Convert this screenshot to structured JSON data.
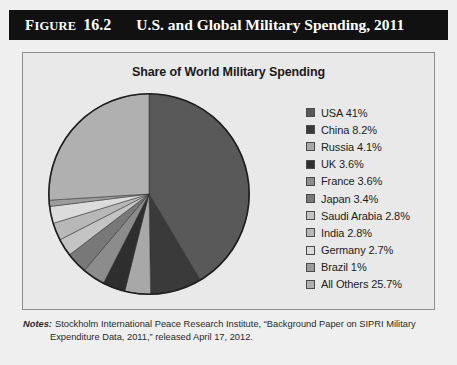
{
  "figure": {
    "label_first": "F",
    "label_rest": "IGURE",
    "number": "16.2",
    "title": "U.S. and Global Military Spending, 2011"
  },
  "chart_data": {
    "type": "pie",
    "title": "Share of World Military Spending",
    "xlabel": "",
    "ylabel": "",
    "legend_position": "right",
    "start_angle_deg": 0,
    "direction": "clockwise",
    "categories": [
      "USA",
      "China",
      "Russia",
      "UK",
      "France",
      "Japan",
      "Saudi Arabia",
      "India",
      "Germany",
      "Brazil",
      "All Others"
    ],
    "values": [
      41,
      8.2,
      4.1,
      3.6,
      3.6,
      3.4,
      2.8,
      2.8,
      2.7,
      1,
      25.7
    ],
    "value_labels": [
      "41%",
      "8.2%",
      "4.1%",
      "3.6%",
      "3.6%",
      "3.4%",
      "2.8%",
      "2.8%",
      "2.7%",
      "1%",
      "25.7%"
    ],
    "colors": [
      "#595959",
      "#3a3a3a",
      "#a8a8a8",
      "#2e2e2e",
      "#8c8c8c",
      "#787878",
      "#c4c4c4",
      "#b8b8b8",
      "#dcdcdc",
      "#9c9c9c",
      "#b0b0b0"
    ],
    "legend_entries": [
      {
        "label": "USA 41%",
        "color": "#595959"
      },
      {
        "label": "China 8.2%",
        "color": "#3a3a3a"
      },
      {
        "label": "Russia 4.1%",
        "color": "#a8a8a8"
      },
      {
        "label": "UK 3.6%",
        "color": "#2e2e2e"
      },
      {
        "label": "France 3.6%",
        "color": "#8c8c8c"
      },
      {
        "label": "Japan 3.4%",
        "color": "#787878"
      },
      {
        "label": "Saudi Arabia 2.8%",
        "color": "#c4c4c4"
      },
      {
        "label": "India 2.8%",
        "color": "#b8b8b8"
      },
      {
        "label": "Germany 2.7%",
        "color": "#dcdcdc"
      },
      {
        "label": "Brazil 1%",
        "color": "#9c9c9c"
      },
      {
        "label": "All Others 25.7%",
        "color": "#b0b0b0"
      }
    ]
  },
  "notes": {
    "label": "Notes:",
    "line1": "Stockholm International Peace Research Institute, “Background Paper on SIPRI Military",
    "line2": "Expenditure Data, 2011,” released April 17, 2012."
  }
}
